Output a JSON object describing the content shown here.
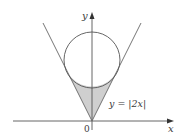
{
  "figure": {
    "type": "geometry-diagram",
    "axes": {
      "x_label": "x",
      "y_label": "y",
      "origin_label": "0"
    },
    "curve_label": "y = |2x|",
    "colors": {
      "line": "#555555",
      "axis": "#555555",
      "shade": "#cfcfcf",
      "background": "#ffffff"
    }
  }
}
